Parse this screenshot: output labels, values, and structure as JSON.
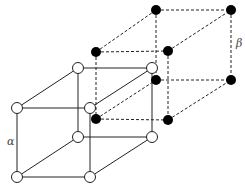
{
  "diagram": {
    "labels": {
      "alpha": "α",
      "beta": "β"
    },
    "lattice_alpha": {
      "node_style": "open-circle",
      "edge_style": "solid",
      "nodes": [
        [
          17,
          108
        ],
        [
          90,
          108
        ],
        [
          17,
          177
        ],
        [
          90,
          177
        ],
        [
          78,
          68
        ],
        [
          152,
          68
        ],
        [
          78,
          137
        ],
        [
          152,
          137
        ]
      ]
    },
    "lattice_beta": {
      "node_style": "filled-circle",
      "edge_style": "dashed",
      "nodes": [
        [
          96,
          52
        ],
        [
          168,
          51
        ],
        [
          96,
          119
        ],
        [
          168,
          120
        ],
        [
          156,
          10
        ],
        [
          231,
          10
        ],
        [
          156,
          80
        ],
        [
          231,
          80
        ]
      ]
    },
    "colors": {
      "line": "#222222",
      "filled_node": "#000000",
      "open_node_fill": "#ffffff"
    }
  }
}
